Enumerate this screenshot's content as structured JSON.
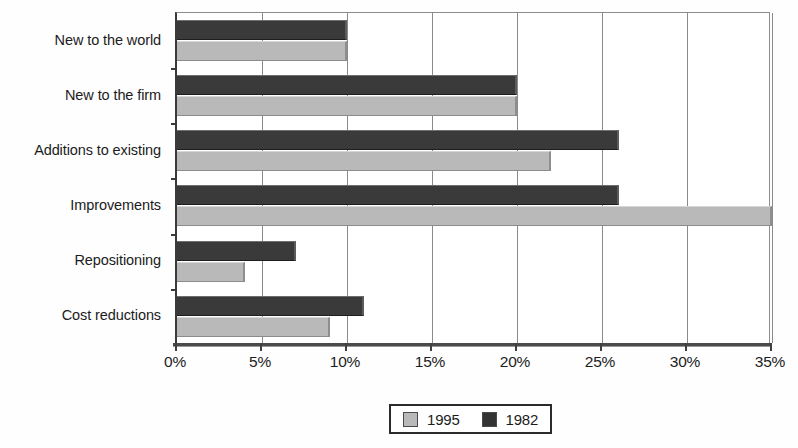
{
  "chart_data": {
    "type": "bar",
    "orientation": "horizontal",
    "title": "",
    "subtitle": "",
    "xlabel": "",
    "ylabel": "",
    "xlim": [
      0,
      35
    ],
    "xtick_step": 5,
    "xticks": [
      "0%",
      "5%",
      "10%",
      "15%",
      "20%",
      "25%",
      "30%",
      "35%"
    ],
    "xtick_values": [
      0,
      5,
      10,
      15,
      20,
      25,
      30,
      35
    ],
    "grid": "vertical",
    "legend_position": "bottom-center",
    "value_unit": "%",
    "categories": [
      "New to the world",
      "New to the firm",
      "Additions to existing",
      "Improvements",
      "Repositioning",
      "Cost reductions"
    ],
    "series": [
      {
        "name": "1982",
        "color": "#3a3a3a",
        "values": [
          10,
          20,
          26,
          26,
          7,
          11
        ]
      },
      {
        "name": "1995",
        "color": "#b9b9b9",
        "values": [
          10,
          20,
          22,
          35,
          4,
          9
        ]
      }
    ]
  },
  "legend": {
    "entries": [
      {
        "label": "1995",
        "swatch": "light"
      },
      {
        "label": "1982",
        "swatch": "dark"
      }
    ]
  }
}
